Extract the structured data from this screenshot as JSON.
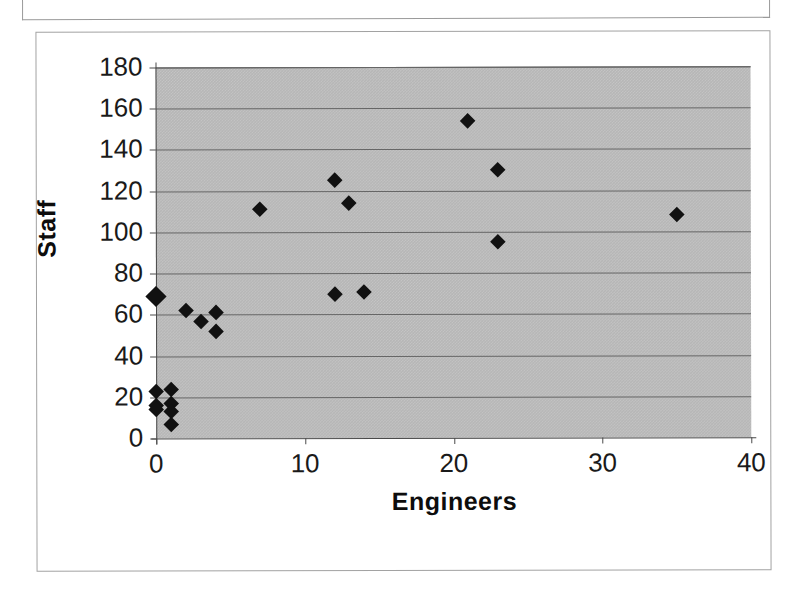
{
  "page": {
    "background_color": "#ffffff",
    "scan_artifact_top_frame": true
  },
  "chart_data": {
    "type": "scatter",
    "title": "",
    "xlabel": "Engineers",
    "ylabel": "Staff",
    "xlim": [
      0,
      40
    ],
    "ylim": [
      0,
      180
    ],
    "xticks": [
      0,
      10,
      20,
      30,
      40
    ],
    "yticks": [
      0,
      20,
      40,
      60,
      80,
      100,
      120,
      140,
      160,
      180
    ],
    "xtick_labels": [
      "0",
      "10",
      "20",
      "30",
      "40"
    ],
    "ytick_labels": [
      "0",
      "20",
      "40",
      "60",
      "80",
      "100",
      "120",
      "140",
      "160",
      "180"
    ],
    "grid": "horizontal",
    "plot_background_color": "#b6b6b6",
    "gridline_color": "#666666",
    "marker_color": "#111111",
    "marker_shape": "diamond",
    "legend": null,
    "series": [
      {
        "name": "Staff vs Engineers",
        "points": [
          {
            "x": 0,
            "y": 69,
            "overlapping": true
          },
          {
            "x": 0,
            "y": 23
          },
          {
            "x": 0,
            "y": 16
          },
          {
            "x": 0,
            "y": 14
          },
          {
            "x": 1,
            "y": 24
          },
          {
            "x": 1,
            "y": 17
          },
          {
            "x": 1,
            "y": 13
          },
          {
            "x": 1,
            "y": 7
          },
          {
            "x": 2,
            "y": 62
          },
          {
            "x": 3,
            "y": 57
          },
          {
            "x": 4,
            "y": 61
          },
          {
            "x": 4,
            "y": 52
          },
          {
            "x": 7,
            "y": 111
          },
          {
            "x": 12,
            "y": 125
          },
          {
            "x": 12,
            "y": 70
          },
          {
            "x": 13,
            "y": 114
          },
          {
            "x": 14,
            "y": 71
          },
          {
            "x": 21,
            "y": 154
          },
          {
            "x": 23,
            "y": 130
          },
          {
            "x": 23,
            "y": 95
          },
          {
            "x": 35,
            "y": 108
          }
        ]
      }
    ]
  }
}
